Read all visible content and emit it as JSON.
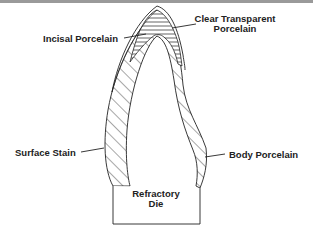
{
  "diagram": {
    "type": "cross-section",
    "labels": {
      "clear_transparent": [
        "Clear Transparent",
        "Porcelain"
      ],
      "incisal": "Incisal Porcelain",
      "surface_stain": "Surface Stain",
      "body": "Body Porcelain",
      "die": [
        "Refractory",
        "Die"
      ]
    },
    "colors": {
      "line": "#222222",
      "background": "#ffffff",
      "top_rule": "#9a9a9a"
    }
  }
}
